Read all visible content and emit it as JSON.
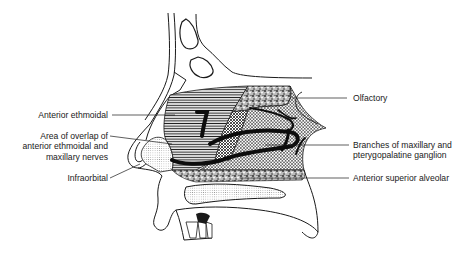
{
  "figure": {
    "labels_left": [
      {
        "id": "anterior-ethmoidal",
        "lines": [
          "Anterior ethmoidal"
        ]
      },
      {
        "id": "area-of-overlap",
        "lines": [
          "Area of overlap of",
          "anterior ethmoidal and",
          "maxillary nerves"
        ]
      },
      {
        "id": "infraorbital",
        "lines": [
          "Infraorbital"
        ]
      }
    ],
    "labels_right": [
      {
        "id": "olfactory",
        "lines": [
          "Olfactory"
        ]
      },
      {
        "id": "branches-maxillary",
        "lines": [
          "Branches of maxillary and",
          "pterygopalatine ganglion"
        ]
      },
      {
        "id": "anterior-superior-alveolar",
        "lines": [
          "Anterior superior  alveolar"
        ]
      }
    ],
    "colors": {
      "ink": "#1a1a1a",
      "background": "#ffffff"
    }
  }
}
